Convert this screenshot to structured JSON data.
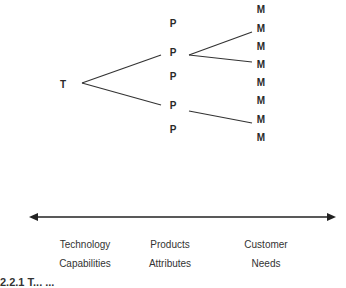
{
  "diagram": {
    "root": {
      "label": "T",
      "x": 63,
      "y": 84
    },
    "products": [
      {
        "label": "P",
        "x": 173,
        "y": 24
      },
      {
        "label": "P",
        "x": 173,
        "y": 53
      },
      {
        "label": "P",
        "x": 173,
        "y": 77
      },
      {
        "label": "P",
        "x": 173,
        "y": 106
      },
      {
        "label": "P",
        "x": 173,
        "y": 130
      }
    ],
    "needs": [
      {
        "label": "M",
        "x": 261,
        "y": 10
      },
      {
        "label": "M",
        "x": 261,
        "y": 29
      },
      {
        "label": "M",
        "x": 261,
        "y": 47
      },
      {
        "label": "M",
        "x": 261,
        "y": 65
      },
      {
        "label": "M",
        "x": 261,
        "y": 83
      },
      {
        "label": "M",
        "x": 261,
        "y": 101
      },
      {
        "label": "M",
        "x": 261,
        "y": 120
      },
      {
        "label": "M",
        "x": 261,
        "y": 138
      }
    ],
    "edges": [
      {
        "from": "T",
        "to": "P2"
      },
      {
        "from": "T",
        "to": "P4"
      },
      {
        "from": "P2",
        "to": "M2"
      },
      {
        "from": "P2",
        "to": "M4"
      },
      {
        "from": "P4",
        "to": "M7"
      }
    ],
    "axis": {
      "type": "double-arrow"
    },
    "axis_labels": [
      {
        "line1": "Technology",
        "line2": "Capabilities",
        "x": 85
      },
      {
        "line1": "Products",
        "line2": "Attributes",
        "x": 170
      },
      {
        "line1": "Customer",
        "line2": "Needs",
        "x": 266
      }
    ],
    "caption_partial": "2.2.1  T...                        ..."
  }
}
